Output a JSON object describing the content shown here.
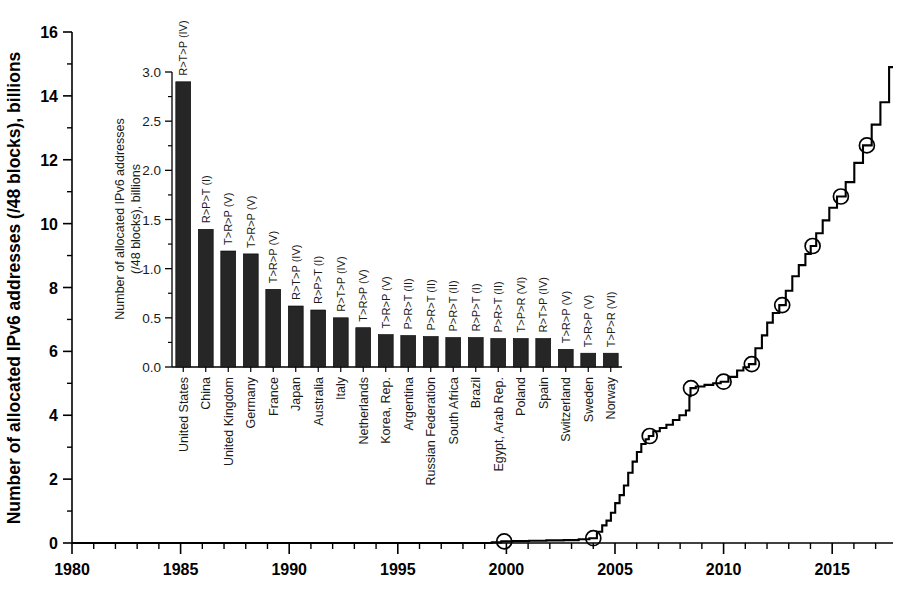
{
  "chart_data": [
    {
      "id": "main",
      "type": "line",
      "title": "",
      "xlabel": "",
      "ylabel": "Number of allocated IPv6 addresses (/48 blocks), billions",
      "xlim": [
        1980,
        2017.8
      ],
      "ylim": [
        0,
        16
      ],
      "xticks": [
        1980,
        1985,
        1990,
        1995,
        2000,
        2005,
        2010,
        2015
      ],
      "xtick_labels": [
        "1980",
        "1985",
        "1990",
        "1995",
        "2000",
        "2005",
        "2010",
        "2015"
      ],
      "yticks": [
        0,
        2,
        4,
        6,
        8,
        10,
        12,
        14,
        16
      ],
      "ytick_labels": [
        "0",
        "2",
        "4",
        "6",
        "8",
        "10",
        "12",
        "14",
        "16"
      ],
      "minor_xtick_interval": 1,
      "minor_ytick_interval": 1,
      "grid": false,
      "legend": "none",
      "line_style": "step-like cumulative curve",
      "marker": "open-circle",
      "marker_points": [
        {
          "x": 1999.9,
          "y": 0.05
        },
        {
          "x": 2004.0,
          "y": 0.15
        },
        {
          "x": 2006.6,
          "y": 3.35
        },
        {
          "x": 2008.5,
          "y": 4.85
        },
        {
          "x": 2010.0,
          "y": 5.05
        },
        {
          "x": 2011.3,
          "y": 5.6
        },
        {
          "x": 2012.7,
          "y": 7.45
        },
        {
          "x": 2014.1,
          "y": 9.3
        },
        {
          "x": 2015.4,
          "y": 10.85
        },
        {
          "x": 2016.6,
          "y": 12.45
        }
      ],
      "x": [
        1980,
        1999.0,
        1999.6,
        1999.9,
        2000.6,
        2001.4,
        2002.2,
        2003.0,
        2003.6,
        2004.0,
        2004.3,
        2004.5,
        2004.7,
        2004.9,
        2005.1,
        2005.3,
        2005.5,
        2005.7,
        2005.9,
        2006.1,
        2006.3,
        2006.5,
        2006.6,
        2006.9,
        2007.2,
        2007.5,
        2007.8,
        2008.1,
        2008.4,
        2008.45,
        2008.5,
        2008.9,
        2009.3,
        2009.7,
        2010.0,
        2010.4,
        2010.8,
        2011.0,
        2011.3,
        2011.6,
        2011.9,
        2012.1,
        2012.4,
        2012.7,
        2013.0,
        2013.3,
        2013.6,
        2013.9,
        2014.1,
        2014.4,
        2014.7,
        2015.0,
        2015.4,
        2015.8,
        2016.2,
        2016.6,
        2017.0,
        2017.4,
        2017.8
      ],
      "y": [
        0.0,
        0.0,
        0.02,
        0.05,
        0.06,
        0.07,
        0.08,
        0.09,
        0.12,
        0.15,
        0.35,
        0.55,
        0.7,
        0.95,
        1.25,
        1.5,
        1.8,
        2.2,
        2.55,
        2.85,
        3.1,
        3.25,
        3.35,
        3.5,
        3.6,
        3.7,
        3.85,
        4.0,
        4.15,
        4.6,
        4.85,
        4.9,
        4.95,
        5.0,
        5.05,
        5.2,
        5.4,
        5.5,
        5.6,
        6.1,
        6.5,
        6.9,
        7.2,
        7.45,
        7.9,
        8.35,
        8.7,
        9.05,
        9.3,
        9.7,
        10.1,
        10.5,
        10.85,
        11.3,
        11.9,
        12.45,
        13.1,
        13.8,
        14.9
      ]
    },
    {
      "id": "inset",
      "type": "bar",
      "title": "",
      "xlabel": "",
      "ylabel": "Number of allocated IPv6 addresses (/48 blocks), billions",
      "ylim": [
        0.0,
        3.0
      ],
      "yticks": [
        0.0,
        0.5,
        1.0,
        1.5,
        2.0,
        2.5,
        3.0
      ],
      "ytick_labels": [
        "0.0",
        "0.5",
        "1.0",
        "1.5",
        "2.0",
        "2.5",
        "3.0"
      ],
      "grid": false,
      "legend": "none",
      "bar_color": "#262626",
      "categories": [
        "United States",
        "China",
        "United Kingdom",
        "Germany",
        "France",
        "Japan",
        "Australia",
        "Italy",
        "Netherlands",
        "Korea, Rep.",
        "Argentina",
        "Russian Federation",
        "South Africa",
        "Brazil",
        "Egypt, Arab Rep.",
        "Poland",
        "Spain",
        "Switzerland",
        "Sweden",
        "Norway"
      ],
      "values": [
        2.9,
        1.4,
        1.18,
        1.15,
        0.79,
        0.62,
        0.58,
        0.5,
        0.4,
        0.33,
        0.32,
        0.31,
        0.3,
        0.3,
        0.29,
        0.29,
        0.29,
        0.18,
        0.14,
        0.14
      ],
      "annotations": [
        "R>T>P (IV)",
        "R>P>T (I)",
        "T>R>P (V)",
        "T>R>P (V)",
        "T>R>P (V)",
        "R>T>P (IV)",
        "R>P>T (I)",
        "R>T>P (IV)",
        "T>R>P (V)",
        "T>R>P (V)",
        "P>R>T (II)",
        "P>R>T (II)",
        "P>R>T (II)",
        "R>P>T (I)",
        "P>R>T (II)",
        "T>P>R (VI)",
        "R>T>P (IV)",
        "T>R>P (V)",
        "T>R>P (V)",
        "T>P>R (VI)"
      ]
    }
  ]
}
